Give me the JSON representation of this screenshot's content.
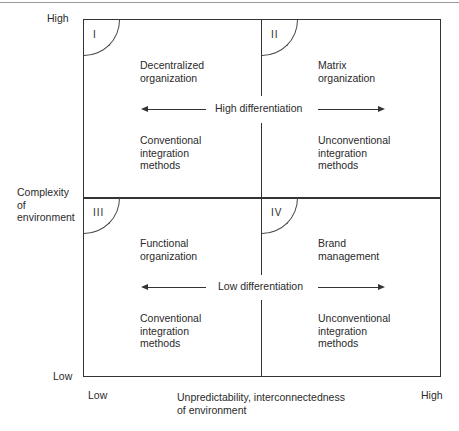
{
  "diagram": {
    "y_axis": {
      "label": "Complexity\nof\nenvironment",
      "high": "High",
      "low": "Low"
    },
    "x_axis": {
      "label": "Unpredictability, interconnectedness\nof environment",
      "low": "Low",
      "high": "High"
    },
    "quadrants": [
      {
        "id": "I",
        "title": "Decentralized\norganization",
        "methods": "Conventional\nintegration\nmethods"
      },
      {
        "id": "II",
        "title": "Matrix\norganization",
        "methods": "Unconventional\nintegration\nmethods"
      },
      {
        "id": "III",
        "title": "Functional\norganization",
        "methods": "Conventional\nintegration\nmethods"
      },
      {
        "id": "IV",
        "title": "Brand\nmanagement",
        "methods": "Unconventional\nintegration\nmethods"
      }
    ],
    "rows": [
      {
        "label": "High differentiation"
      },
      {
        "label": "Low differentiation"
      }
    ]
  }
}
